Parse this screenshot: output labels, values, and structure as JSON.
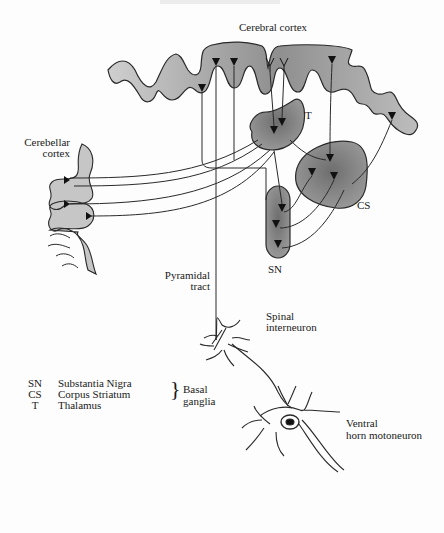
{
  "title": "Cerebral cortex",
  "labels": {
    "cerebral_cortex": "Cerebral cortex",
    "cerebellar_cortex_line1": "Cerebellar",
    "cerebellar_cortex_line2": "cortex",
    "thalamus": "T",
    "corpus_striatum": "CS",
    "substantia_nigra": "SN",
    "pyramidal_tract_line1": "Pyramidal",
    "pyramidal_tract_line2": "tract",
    "spinal_interneuron_line1": "Spinal",
    "spinal_interneuron_line2": "interneuron",
    "ventral_horn_line1": "Ventral",
    "ventral_horn_line2": "horn motoneuron"
  },
  "legend": {
    "items": [
      {
        "abbr": "SN",
        "name": "Substantia Nigra"
      },
      {
        "abbr": "CS",
        "name": "Corpus Striatum"
      },
      {
        "abbr": "T",
        "name": "Thalamus"
      }
    ],
    "group_brace": "}",
    "group_label": "Basal ganglia"
  },
  "colors": {
    "cortex_fill": "#c4c4c4",
    "nucleus_fill": "#8a8a8a",
    "stroke": "#2a2a2a",
    "background": "#fdfdfd"
  }
}
